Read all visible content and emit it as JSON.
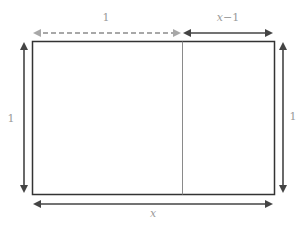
{
  "diagram": {
    "labels": {
      "top_left_segment": "1",
      "top_right_segment_var": "x",
      "top_right_segment_rest": "−1",
      "left_height": "1",
      "right_height": "1",
      "bottom_width": "x"
    },
    "colors": {
      "rect_stroke": "#333333",
      "divider": "#8a8a8a",
      "dashed_arrow": "#a8a8a8",
      "solid_arrow": "#444444",
      "label": "#9a9a9a"
    },
    "shapes": {
      "outer_rectangle": {
        "x": 32,
        "y": 41,
        "width": 242,
        "height": 153
      },
      "divider_x": 182
    }
  }
}
